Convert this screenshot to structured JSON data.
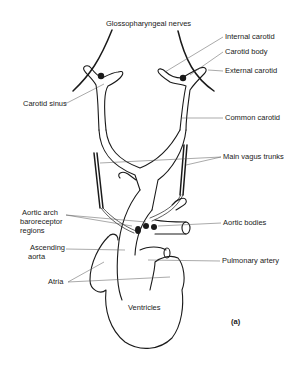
{
  "figure": {
    "panel_label": "(a)",
    "labels": {
      "glossopharyngeal": "Glossopharyngeal nerves",
      "internal_carotid": "Internal carotid",
      "carotid_body": "Carotid body",
      "external_carotid": "External carotid",
      "carotid_sinus": "Carotid sinus",
      "common_carotid": "Common carotid",
      "main_vagus": "Main vagus trunks",
      "aortic_arch_1": "Aortic arch",
      "aortic_arch_2": "baroreceptor",
      "aortic_arch_3": "regions",
      "aortic_bodies": "Aortic bodies",
      "ascending_1": "Ascending",
      "ascending_2": "aorta",
      "pulmonary": "Pulmonary artery",
      "atria": "Atria",
      "ventricles": "Ventricles"
    }
  }
}
